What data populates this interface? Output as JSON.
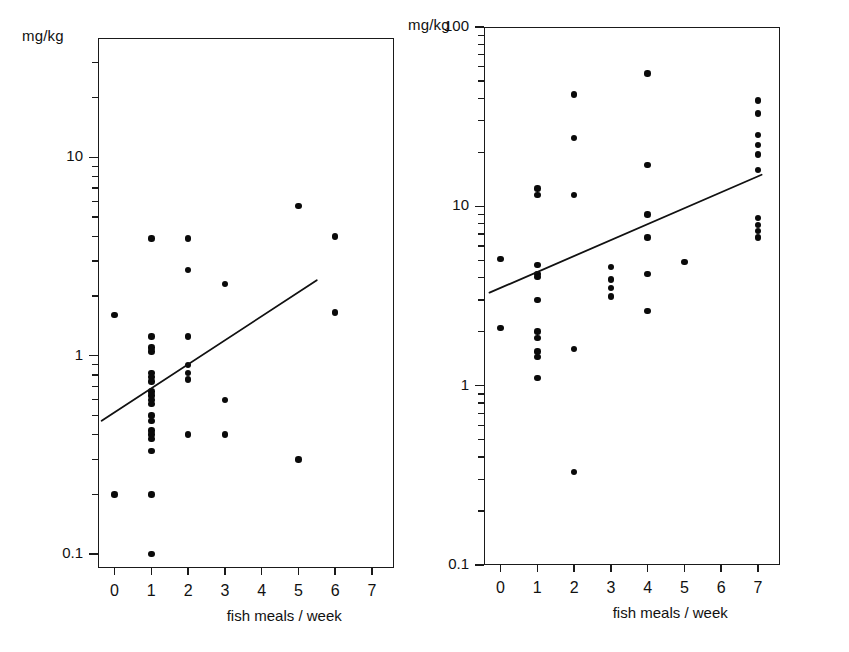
{
  "figure": {
    "background_color": "#ffffff",
    "ink_color": "#111111",
    "panel_count": 2
  },
  "chart_data": [
    {
      "id": "left-panel",
      "type": "scatter",
      "title": "",
      "xlabel": "fish meals / week",
      "ylabel": "mg/kg",
      "ylabel_position": "above-axis",
      "yscale": "log",
      "xscale": "linear",
      "grid": false,
      "legend": null,
      "xlim": [
        -0.45,
        7.6
      ],
      "ylim": [
        0.085,
        40
      ],
      "xticks": [
        0,
        1,
        2,
        3,
        4,
        5,
        6,
        7
      ],
      "xticklabels": [
        "0",
        "1",
        "2",
        "3",
        "4",
        "5",
        "6",
        "7"
      ],
      "yticks_major": [
        0.1,
        1,
        10
      ],
      "yticklabels_major": [
        "0.1",
        "1",
        "10"
      ],
      "yticks_minor": [
        0.2,
        0.3,
        0.4,
        0.5,
        0.6,
        0.7,
        0.8,
        0.9,
        2,
        3,
        4,
        5,
        6,
        7,
        8,
        9,
        20,
        30
      ],
      "points": [
        {
          "x": 0,
          "y": 1.6
        },
        {
          "x": 0,
          "y": 0.2
        },
        {
          "x": 1,
          "y": 3.9
        },
        {
          "x": 1,
          "y": 1.25
        },
        {
          "x": 1,
          "y": 1.1
        },
        {
          "x": 1,
          "y": 1.05
        },
        {
          "x": 1,
          "y": 0.82
        },
        {
          "x": 1,
          "y": 0.78
        },
        {
          "x": 1,
          "y": 0.74
        },
        {
          "x": 1,
          "y": 0.66
        },
        {
          "x": 1,
          "y": 0.63
        },
        {
          "x": 1,
          "y": 0.6
        },
        {
          "x": 1,
          "y": 0.57
        },
        {
          "x": 1,
          "y": 0.5
        },
        {
          "x": 1,
          "y": 0.47
        },
        {
          "x": 1,
          "y": 0.42
        },
        {
          "x": 1,
          "y": 0.4
        },
        {
          "x": 1,
          "y": 0.38
        },
        {
          "x": 1,
          "y": 0.33
        },
        {
          "x": 1,
          "y": 0.2
        },
        {
          "x": 1,
          "y": 0.1
        },
        {
          "x": 2,
          "y": 3.9
        },
        {
          "x": 2,
          "y": 2.7
        },
        {
          "x": 2,
          "y": 1.25
        },
        {
          "x": 2,
          "y": 0.9
        },
        {
          "x": 2,
          "y": 0.82
        },
        {
          "x": 2,
          "y": 0.76
        },
        {
          "x": 2,
          "y": 0.4
        },
        {
          "x": 3,
          "y": 2.3
        },
        {
          "x": 3,
          "y": 0.6
        },
        {
          "x": 3,
          "y": 0.4
        },
        {
          "x": 5,
          "y": 5.7
        },
        {
          "x": 5,
          "y": 0.3
        },
        {
          "x": 6,
          "y": 4.0
        },
        {
          "x": 6,
          "y": 1.65
        }
      ],
      "regression_line": {
        "x_start": -0.35,
        "y_start": 0.47,
        "x_end": 5.5,
        "y_end": 2.4
      }
    },
    {
      "id": "right-panel",
      "type": "scatter",
      "title": "",
      "xlabel": "fish meals / week",
      "ylabel": "mg/kg",
      "ylabel_position": "above-axis",
      "yscale": "log",
      "xscale": "linear",
      "grid": false,
      "legend": null,
      "xlim": [
        -0.45,
        7.6
      ],
      "ylim": [
        0.1,
        100
      ],
      "xticks": [
        0,
        1,
        2,
        3,
        4,
        5,
        6,
        7
      ],
      "xticklabels": [
        "0",
        "1",
        "2",
        "3",
        "4",
        "5",
        "6",
        "7"
      ],
      "yticks_major": [
        0.1,
        1,
        10,
        100
      ],
      "yticklabels_major": [
        "0.1",
        "1",
        "10",
        "100"
      ],
      "yticks_minor": [
        0.2,
        0.3,
        0.4,
        0.5,
        0.6,
        0.7,
        0.8,
        0.9,
        2,
        3,
        4,
        5,
        6,
        7,
        8,
        9,
        20,
        30,
        40,
        50,
        60,
        70,
        80,
        90
      ],
      "points": [
        {
          "x": 0,
          "y": 5.1
        },
        {
          "x": 0,
          "y": 2.1
        },
        {
          "x": 1,
          "y": 12.6
        },
        {
          "x": 1,
          "y": 11.6
        },
        {
          "x": 1,
          "y": 4.7
        },
        {
          "x": 1,
          "y": 4.2
        },
        {
          "x": 1,
          "y": 4.05
        },
        {
          "x": 1,
          "y": 3.0
        },
        {
          "x": 1,
          "y": 2.0
        },
        {
          "x": 1,
          "y": 1.85
        },
        {
          "x": 1,
          "y": 1.55
        },
        {
          "x": 1,
          "y": 1.45
        },
        {
          "x": 1,
          "y": 1.1
        },
        {
          "x": 2,
          "y": 42
        },
        {
          "x": 2,
          "y": 24
        },
        {
          "x": 2,
          "y": 11.6
        },
        {
          "x": 2,
          "y": 1.6
        },
        {
          "x": 2,
          "y": 0.33
        },
        {
          "x": 3,
          "y": 4.6
        },
        {
          "x": 3,
          "y": 3.9
        },
        {
          "x": 3,
          "y": 3.5
        },
        {
          "x": 3,
          "y": 3.15
        },
        {
          "x": 4,
          "y": 55
        },
        {
          "x": 4,
          "y": 17
        },
        {
          "x": 4,
          "y": 9.0
        },
        {
          "x": 4,
          "y": 6.7
        },
        {
          "x": 4,
          "y": 4.2
        },
        {
          "x": 4,
          "y": 2.6
        },
        {
          "x": 5,
          "y": 4.9
        },
        {
          "x": 7,
          "y": 39
        },
        {
          "x": 7,
          "y": 33
        },
        {
          "x": 7,
          "y": 25
        },
        {
          "x": 7,
          "y": 22
        },
        {
          "x": 7,
          "y": 19.5
        },
        {
          "x": 7,
          "y": 16
        },
        {
          "x": 7,
          "y": 8.6
        },
        {
          "x": 7,
          "y": 7.9
        },
        {
          "x": 7,
          "y": 7.3
        },
        {
          "x": 7,
          "y": 6.7
        }
      ],
      "regression_line": {
        "x_start": -0.3,
        "y_start": 3.3,
        "x_end": 7.1,
        "y_end": 15.0
      }
    }
  ]
}
